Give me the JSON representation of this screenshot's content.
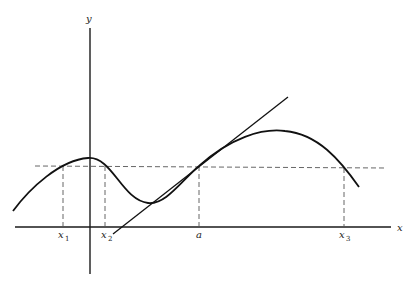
{
  "diagram": {
    "axes": {
      "x_label": "x",
      "y_label": "y"
    },
    "points": [
      {
        "id": "x1",
        "base": "x",
        "sub": "1"
      },
      {
        "id": "x2",
        "base": "x",
        "sub": "2"
      },
      {
        "id": "a",
        "base": "a",
        "sub": ""
      },
      {
        "id": "x3",
        "base": "x",
        "sub": "3"
      }
    ],
    "elements": {
      "curve": "y = f(x)",
      "horizontal_dashed_line": "y = f(a)",
      "tangent_line": "tangent to f at x = a",
      "vertical_dashed_lines": [
        "x1",
        "x2",
        "a",
        "x3"
      ]
    },
    "colors": {
      "ink": "#111111",
      "dashed": "#555555",
      "background": "#ffffff"
    }
  }
}
